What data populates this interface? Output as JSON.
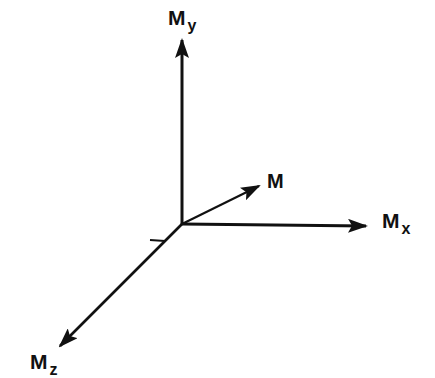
{
  "diagram": {
    "title": "",
    "colors": {
      "background": "#ffffff",
      "ink": "#111111"
    },
    "origin": {
      "x": 182,
      "y": 224
    },
    "axes": [
      {
        "id": "my",
        "label_main": "M",
        "label_sub": "y",
        "direction": "up",
        "from": [
          182,
          224
        ],
        "to": [
          182,
          38
        ]
      },
      {
        "id": "mx",
        "label_main": "M",
        "label_sub": "x",
        "direction": "right",
        "from": [
          182,
          224
        ],
        "to": [
          366,
          226
        ]
      },
      {
        "id": "mz",
        "label_main": "M",
        "label_sub": "z",
        "direction": "down-left",
        "from": [
          182,
          224
        ],
        "to": [
          60,
          346
        ]
      }
    ],
    "vector": {
      "id": "m",
      "label_main": "M",
      "from": [
        182,
        224
      ],
      "to": [
        259,
        186
      ]
    }
  }
}
